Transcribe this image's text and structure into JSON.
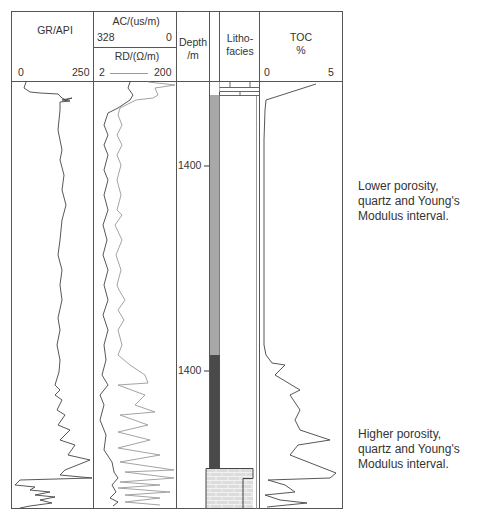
{
  "header": {
    "gr": {
      "title": "GR/API",
      "min": "0",
      "max": "250"
    },
    "ac": {
      "title": "AC/(us/m)",
      "min": "328",
      "max": "0"
    },
    "rd": {
      "title": "RD/(Ω/m)",
      "min": "2",
      "max": "200"
    },
    "depth": {
      "title_line1": "Depth",
      "title_line2": "/m"
    },
    "litho": {
      "title_line1": "Litho-",
      "title_line2": "facies"
    },
    "toc": {
      "title_line1": "TOC",
      "title_line2": "%",
      "min": "0",
      "max": "5"
    }
  },
  "depth_labels": [
    {
      "label": "1400",
      "y": 165
    },
    {
      "label": "1400",
      "y": 370
    }
  ],
  "annotations": {
    "upper": [
      "Lower porosity,",
      "quartz and Young's",
      "Modulus interval."
    ],
    "lower": [
      "Higher porosity,",
      "quartz and Young's",
      "Modulus interval."
    ]
  },
  "lithology": [
    {
      "name": "cap-layers",
      "from_y": 82,
      "to_y": 95,
      "color": "#ffffff"
    },
    {
      "name": "light-grey-shale",
      "from_y": 95,
      "to_y": 355,
      "color": "#a8a8a8"
    },
    {
      "name": "dark-shale",
      "from_y": 355,
      "to_y": 468,
      "color": "#4a4a4a"
    },
    {
      "name": "limestone",
      "from_y": 468,
      "to_y": 508,
      "color": "#d8d8d8"
    }
  ],
  "colors": {
    "frame": "#555555",
    "curve_dark": "#444444",
    "curve_light": "#999999"
  }
}
